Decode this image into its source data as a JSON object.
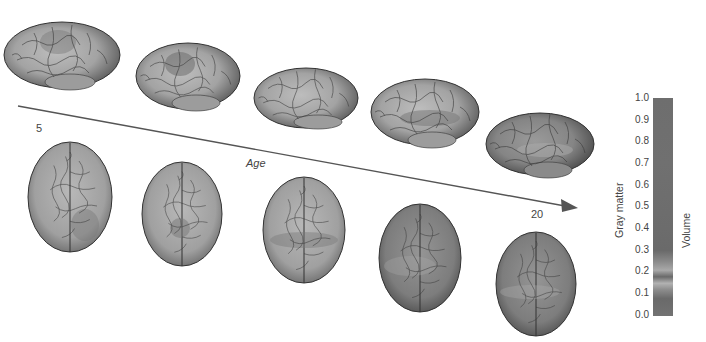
{
  "figure": {
    "axis": {
      "label": "Age",
      "start_label": "5",
      "end_label": "20"
    },
    "colorbar": {
      "title": "Gray matter",
      "subtitle": "Volume",
      "ticks": [
        "1.0",
        "0.9",
        "0.8",
        "0.7",
        "0.6",
        "0.5",
        "0.4",
        "0.3",
        "0.2",
        "0.1",
        "0.0"
      ],
      "colors": {
        "base": "#6e6e6e",
        "highlight": "#b2b2b2"
      }
    },
    "rows": {
      "lateral_count": 5,
      "top_view_count": 5
    }
  }
}
